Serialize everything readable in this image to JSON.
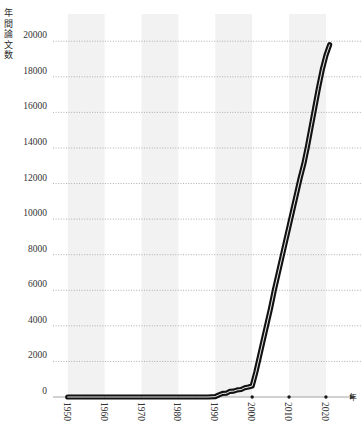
{
  "chart_data": {
    "type": "line",
    "title": "",
    "xlabel": "年",
    "ylabel": "年間論文数",
    "xlim": [
      1946,
      2023
    ],
    "ylim": [
      0,
      20800
    ],
    "grid": true,
    "legend": false,
    "x_ticks": [
      1950,
      1960,
      1970,
      1980,
      1990,
      2000,
      2010,
      2020
    ],
    "y_ticks": [
      0,
      2000,
      4000,
      6000,
      8000,
      10000,
      12000,
      14000,
      16000,
      18000,
      20000
    ],
    "series": [
      {
        "name": "年間論文数",
        "x": [
          1950,
          1955,
          1960,
          1965,
          1970,
          1975,
          1980,
          1985,
          1988,
          1990,
          1991,
          1992,
          1993,
          1994,
          1995,
          1996,
          1997,
          1998,
          1999,
          2000,
          2001,
          2002,
          2003,
          2004,
          2005,
          2006,
          2007,
          2008,
          2009,
          2010,
          2011,
          2012,
          2013,
          2014,
          2015,
          2016,
          2017,
          2018,
          2019,
          2020,
          2021
        ],
        "values": [
          0,
          0,
          0,
          0,
          0,
          0,
          0,
          0,
          0,
          20,
          120,
          200,
          210,
          320,
          330,
          400,
          420,
          520,
          560,
          620,
          1400,
          2300,
          3200,
          4100,
          5000,
          6000,
          6900,
          7800,
          8700,
          9600,
          10500,
          11400,
          12300,
          13100,
          14100,
          15200,
          16300,
          17400,
          18400,
          19200,
          19800
        ]
      }
    ]
  },
  "axes": {
    "y_axis_label_chars": [
      "年",
      "間",
      "論",
      "文",
      "数"
    ],
    "x_axis_label": "年"
  },
  "style": {
    "line_color": "#111111",
    "band_color": "#f2f2f2",
    "grid_color": "#9a9a9a",
    "axis_color": "#9a9a9a",
    "text_color": "#333333"
  }
}
